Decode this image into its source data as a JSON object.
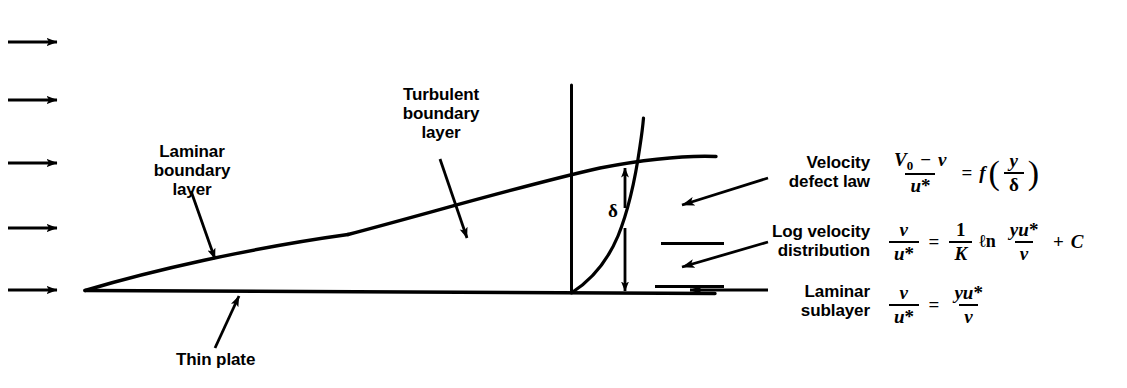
{
  "figure": {
    "type": "boundary-layer-diagram",
    "background": "#ffffff",
    "ink": "#000000"
  },
  "labels": {
    "laminar_boundary_layer": "Laminar\nboundary\nlayer",
    "turbulent_boundary_layer": "Turbulent\nboundary\nlayer",
    "thin_plate": "Thin plate",
    "delta_symbol": "δ",
    "velocity_defect_law": "Velocity\ndefect law",
    "log_velocity_distribution": "Log velocity\ndistribution",
    "laminar_sublayer": "Laminar\nsublayer"
  },
  "equations": {
    "velocity_defect_law": {
      "plain": "(V0 - v)/u* = f(y/δ)",
      "num_left": "V",
      "num_left_sub": "0",
      "num_minus": "−",
      "num_right": "v",
      "den": "u",
      "den_star": "*",
      "equals": "=",
      "fn": "f",
      "paren_open": "(",
      "paren_close": ")",
      "arg_num": "y",
      "arg_den": "δ"
    },
    "log_velocity_distribution": {
      "plain": "v/u* = (1/K) ln(yu*/ν) + C",
      "lhs_num": "v",
      "lhs_den": "u",
      "lhs_den_star": "*",
      "equals": "=",
      "one": "1",
      "kappa": "K",
      "ln": "ℓn",
      "arg_num_y": "y",
      "arg_num_u": "u",
      "arg_num_star": "*",
      "arg_den": "ν",
      "plus": "+",
      "constant": "C"
    },
    "laminar_sublayer": {
      "plain": "v/u* = yu*/ν",
      "lhs_num": "v",
      "lhs_den": "u",
      "lhs_den_star": "*",
      "equals": "=",
      "rhs_num_y": "y",
      "rhs_num_u": "u",
      "rhs_num_star": "*",
      "rhs_den": "ν"
    }
  },
  "geometry": {
    "inlet_arrows_y": [
      42,
      100,
      163,
      228,
      290
    ],
    "inlet_arrow_x_start": 8,
    "inlet_arrow_x_end": 62,
    "plate": {
      "x1": 85,
      "y1": 290,
      "x2": 713,
      "y2": 293
    },
    "leading_edge": {
      "x": 85,
      "y": 290
    },
    "transition_point": {
      "x": 348,
      "y": 234
    },
    "bl_curve_end": {
      "x": 715,
      "y": 157
    },
    "vertical_reference_line": {
      "x": 571,
      "y_top": 85,
      "y_bottom": 292
    },
    "velocity_profile": {
      "x_base": 571,
      "y_base": 292,
      "x_top": 660,
      "y_top": 118
    },
    "delta_arrow": {
      "x": 625,
      "y_top": 163,
      "y_bottom": 292
    },
    "sublayer_divider_lines": [
      {
        "x1": 661,
        "x2": 723,
        "y": 243
      },
      {
        "x1": 655,
        "x2": 723,
        "y": 287
      }
    ]
  }
}
